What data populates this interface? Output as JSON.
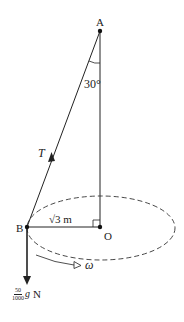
{
  "diagram": {
    "type": "conical-pendulum",
    "colors": {
      "line": "#222222",
      "background": "#ffffff"
    },
    "points": {
      "A": {
        "label": "A"
      },
      "B": {
        "label": "B"
      },
      "O": {
        "label": "O"
      }
    },
    "angle_label": "30°",
    "tension_label": "T",
    "radius_label": "√3 m",
    "angular_velocity_label": "ω",
    "weight": {
      "numerator": "50",
      "denominator": "1000",
      "suffix_var": "g",
      "suffix_unit": "N"
    }
  }
}
